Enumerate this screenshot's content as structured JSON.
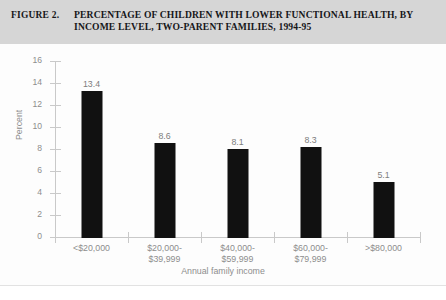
{
  "figure": {
    "number": "FIGURE 2.",
    "title_line1": "PERCENTAGE OF CHILDREN WITH LOWER FUNCTIONAL HEALTH, BY",
    "title_line2": "INCOME LEVEL, TWO-PARENT FAMILIES, 1994-95"
  },
  "chart_data": {
    "type": "bar",
    "title": "PERCENTAGE OF CHILDREN WITH LOWER FUNCTIONAL HEALTH, BY INCOME LEVEL, TWO-PARENT FAMILIES, 1994-95",
    "categories": [
      "<$20,000",
      "$20,000-$39,999",
      "$40,000-$59,999",
      "$60,000-$79,999",
      ">$80,000"
    ],
    "category_lines": [
      [
        "<$20,000"
      ],
      [
        "$20,000-",
        "$39,999"
      ],
      [
        "$40,000-",
        "$59,999"
      ],
      [
        "$60,000-",
        "$79,999"
      ],
      [
        ">$80,000"
      ]
    ],
    "values": [
      13.4,
      8.6,
      8.1,
      8.3,
      5.1
    ],
    "value_labels": [
      "13.4",
      "8.6",
      "8.1",
      "8.3",
      "5.1"
    ],
    "xlabel": "Annual family income",
    "ylabel": "Percent",
    "ylim": [
      0,
      16
    ],
    "yticks": [
      0,
      2,
      4,
      6,
      8,
      10,
      12,
      14,
      16
    ],
    "ytick_labels": [
      "0",
      "2",
      "4",
      "6",
      "8",
      "10",
      "12",
      "14",
      "16"
    ],
    "grid": false,
    "legend": null,
    "bar_color": "#111111",
    "axis_color": "#c9c9c9",
    "text_color": "#8d8d8d",
    "header_background": "#d6d6d6"
  }
}
